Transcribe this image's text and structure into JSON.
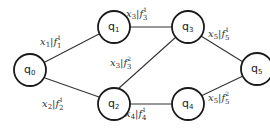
{
  "diagram": {
    "type": "state-graph",
    "nodes": [
      {
        "id": "q0",
        "label": "q",
        "sub": "0",
        "cx": 30,
        "cy": 70
      },
      {
        "id": "q1",
        "label": "q",
        "sub": "1",
        "cx": 114,
        "cy": 27
      },
      {
        "id": "q2",
        "label": "q",
        "sub": "2",
        "cx": 114,
        "cy": 104
      },
      {
        "id": "q3",
        "label": "q",
        "sub": "3",
        "cx": 188,
        "cy": 27
      },
      {
        "id": "q4",
        "label": "q",
        "sub": "4",
        "cx": 188,
        "cy": 104
      },
      {
        "id": "q5",
        "label": "q",
        "sub": "5",
        "cx": 257,
        "cy": 69
      }
    ],
    "edges": [
      {
        "from": "q0",
        "to": "q1",
        "var": "x",
        "var_sub": "1",
        "fn": "f",
        "fn_sub": "1",
        "fn_sup": "1"
      },
      {
        "from": "q0",
        "to": "q2",
        "var": "x",
        "var_sub": "2",
        "fn": "f",
        "fn_sub": "2",
        "fn_sup": "1"
      },
      {
        "from": "q1",
        "to": "q3",
        "var": "x",
        "var_sub": "3",
        "fn": "f",
        "fn_sub": "3",
        "fn_sup": "1"
      },
      {
        "from": "q2",
        "to": "q3",
        "var": "x",
        "var_sub": "3",
        "fn": "f",
        "fn_sub": "3",
        "fn_sup": "2"
      },
      {
        "from": "q2",
        "to": "q4",
        "var": "x",
        "var_sub": "4",
        "fn": "f",
        "fn_sub": "4",
        "fn_sup": "1"
      },
      {
        "from": "q3",
        "to": "q5",
        "var": "x",
        "var_sub": "5",
        "fn": "f",
        "fn_sub": "5",
        "fn_sup": "1"
      },
      {
        "from": "q4",
        "to": "q5",
        "var": "x",
        "var_sub": "5",
        "fn": "f",
        "fn_sub": "5",
        "fn_sup": "2"
      }
    ],
    "colors": {
      "node_stroke": "#1a1a1a",
      "edge_stroke": "#333333",
      "text": "#333333",
      "background": "#ffffff"
    }
  }
}
